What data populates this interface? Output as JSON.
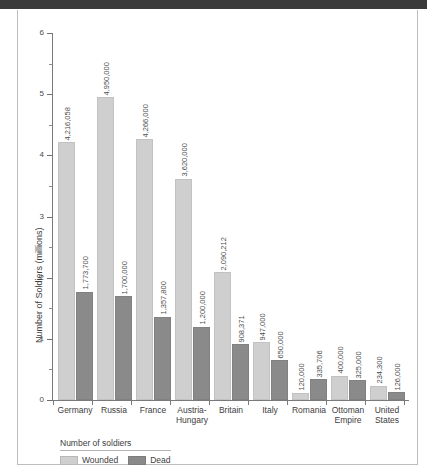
{
  "page": {
    "top_bar_color": "#3a3a3a",
    "background_color": "#ffffff",
    "frame_border_color": "#bdbdbd"
  },
  "chart_data": {
    "type": "bar",
    "title": "",
    "xlabel": "",
    "ylabel": "Number of Soldiers (millions)",
    "ylim": [
      0,
      6
    ],
    "ytick_labels": [
      "0",
      "1",
      "2",
      "3",
      "4",
      "5",
      "6"
    ],
    "yticks": [
      0,
      1,
      2,
      3,
      4,
      5,
      6
    ],
    "minor_ticks": [
      0.5,
      1.5,
      2.5,
      3.5,
      4.5,
      5.5
    ],
    "grid": false,
    "legend_position": "bottom-left",
    "legend_title": "Number of soldiers",
    "categories": [
      "Germany",
      "Russia",
      "France",
      "Austria-Hungary",
      "Britain",
      "Italy",
      "Romania",
      "Ottoman Empire",
      "United States"
    ],
    "category_lines": [
      [
        "Germany"
      ],
      [
        "Russia"
      ],
      [
        "France"
      ],
      [
        "Austria-",
        "Hungary"
      ],
      [
        "Britain"
      ],
      [
        "Italy"
      ],
      [
        "Romania"
      ],
      [
        "Ottoman",
        "Empire"
      ],
      [
        "United",
        "States"
      ]
    ],
    "series": [
      {
        "name": "Wounded",
        "color": "#cfcfcf",
        "values": [
          4216058,
          4950000,
          4266000,
          3620000,
          2090212,
          947000,
          120000,
          400000,
          234300
        ],
        "labels": [
          "4,216,058",
          "4,950,000",
          "4,266,000",
          "3,620,000",
          "2,090,212",
          "947,000",
          "120,000",
          "400,000",
          "234,300"
        ]
      },
      {
        "name": "Dead",
        "color": "#8a8a8a",
        "values": [
          1773700,
          1700000,
          1357800,
          1200000,
          908371,
          650000,
          335706,
          325000,
          126000
        ],
        "labels": [
          "1,773,700",
          "1,700,000",
          "1,357,800",
          "1,200,000",
          "908,371",
          "650,000",
          "335,706",
          "325,000",
          "126,000"
        ]
      }
    ]
  }
}
